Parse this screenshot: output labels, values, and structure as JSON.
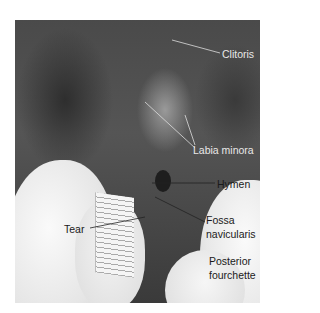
{
  "figure": {
    "labels": {
      "clitoris": "Clitoris",
      "labia_minora": "Labia minora",
      "hymen": "Hymen",
      "fossa_line1": "Fossa",
      "fossa_line2": "navicularis",
      "posterior_line1": "Posterior",
      "posterior_line2": "fourchette",
      "tear": "Tear"
    },
    "ruler_markings": [
      "2",
      "3"
    ]
  }
}
